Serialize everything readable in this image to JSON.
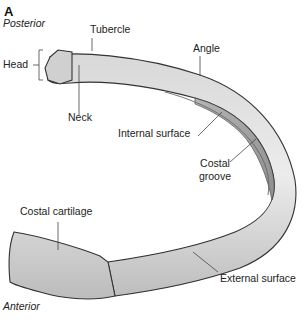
{
  "figure": {
    "panel_letter": "A",
    "orientation": {
      "top": "Posterior",
      "bottom": "Anterior"
    },
    "labels": {
      "tubercle": "Tubercle",
      "head": "Head",
      "neck": "Neck",
      "angle": "Angle",
      "internal_surface": "Internal surface",
      "costal_groove_line1": "Costal",
      "costal_groove_line2": "groove",
      "costal_cartilage": "Costal cartilage",
      "external_surface": "External surface"
    },
    "colors": {
      "bone_light": "#e6e6e6",
      "bone_mid": "#c9c9c9",
      "bone_dark": "#8a8a8a",
      "outline": "#333333",
      "leader": "#444444"
    }
  }
}
